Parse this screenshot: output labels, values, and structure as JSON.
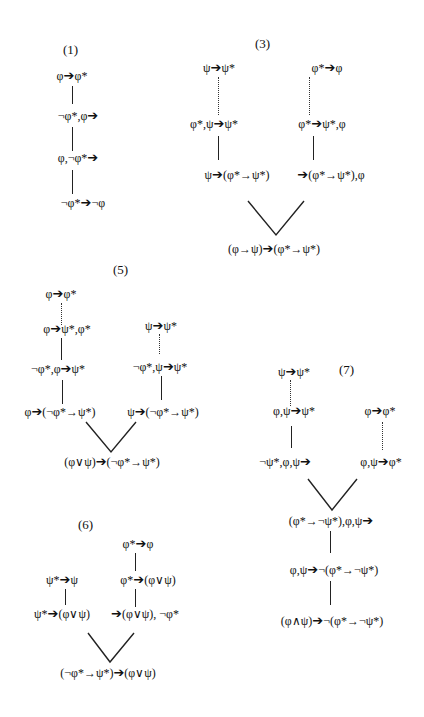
{
  "figure": {
    "proofs": [
      {
        "label": "(1)",
        "nodes": [
          "φ➔φ*",
          "¬φ*,φ➔",
          "φ,¬φ*➔",
          "¬φ*➔¬φ"
        ],
        "links": [
          "solid",
          "solid",
          "solid"
        ]
      },
      {
        "label": "(3)",
        "left_branch": [
          "ψ➔ψ*",
          "φ*,ψ➔ψ*",
          "ψ➔(φ*→ψ*)"
        ],
        "left_links": [
          "dotted",
          "solid"
        ],
        "right_branch": [
          "φ*➔φ",
          "φ*➔ψ*,φ",
          "➔(φ*→ψ*),φ"
        ],
        "right_links": [
          "dotted",
          "solid"
        ],
        "conclusion": "(φ→ψ)➔(φ*→ψ*)"
      },
      {
        "label": "(5)",
        "left_branch": [
          "φ➔φ*",
          "φ➔ψ*,φ*",
          "¬φ*,φ➔ψ*",
          "φ➔(¬φ*→ψ*)"
        ],
        "left_links": [
          "dotted",
          "solid",
          "solid"
        ],
        "right_branch": [
          "ψ➔ψ*",
          "¬φ*,ψ➔ψ*",
          "ψ➔(¬φ*→ψ*)"
        ],
        "right_links": [
          "dotted",
          "solid"
        ],
        "conclusion": "(φ∨ψ)➔(¬φ*→ψ*)"
      },
      {
        "label": "(6)",
        "left_branch": [
          "ψ*➔ψ",
          "ψ*➔(φ∨ψ)"
        ],
        "left_links": [
          "solid"
        ],
        "right_branch": [
          "φ*➔φ",
          "φ*➔(φ∨ψ)",
          "➔(φ∨ψ), ¬φ*"
        ],
        "right_links": [
          "solid",
          "solid"
        ],
        "conclusion": "(¬φ*→ψ*)➔(φ∨ψ)"
      },
      {
        "label": "(7)",
        "left_branch": [
          "ψ➔ψ*",
          "φ,ψ➔ψ*",
          "¬ψ*,φ,ψ➔"
        ],
        "left_links": [
          "dotted",
          "solid"
        ],
        "right_branch": [
          "φ➔φ*",
          "φ,ψ➔φ*"
        ],
        "right_links": [
          "dotted"
        ],
        "after_join": [
          "(φ*→¬ψ*),φ,ψ➔",
          "φ,ψ➔¬(φ*→¬ψ*)",
          "(φ∧ψ)➔¬(φ*→¬ψ*)"
        ],
        "after_join_links": [
          "solid",
          "solid"
        ]
      }
    ]
  },
  "p1": {
    "label": "(1)",
    "n0a": "φ",
    "n0b": "φ*",
    "n1a": "¬φ*,φ",
    "n1b": "",
    "n2a": "φ,¬φ*",
    "n2b": "",
    "n3a": "¬φ*",
    "n3b": "¬φ"
  },
  "p3": {
    "label": "(3)",
    "l0a": "ψ",
    "l0b": "ψ*",
    "l1a": "φ*,ψ",
    "l1b": "ψ*",
    "l2a": "ψ",
    "l2b": "(φ*→ψ*)",
    "r0a": "φ*",
    "r0b": "φ",
    "r1a": "φ*",
    "r1b": "ψ*,φ",
    "r2a": "",
    "r2b": "(φ*→ψ*),φ",
    "ca": "(φ→ψ)",
    "cb": "(φ*→ψ*)"
  },
  "p5": {
    "label": "(5)",
    "l0a": "φ",
    "l0b": "φ*",
    "l1a": "φ",
    "l1b": "ψ*,φ*",
    "l2a": "¬φ*,φ",
    "l2b": "ψ*",
    "l3a": "φ",
    "l3b": "(¬φ*→ψ*)",
    "r0a": "ψ",
    "r0b": "ψ*",
    "r1a": "¬φ*,ψ",
    "r1b": "ψ*",
    "r2a": "ψ",
    "r2b": "(¬φ*→ψ*)",
    "ca": "(φ∨ψ)",
    "cb": "(¬φ*→ψ*)"
  },
  "p6": {
    "label": "(6)",
    "l0a": "ψ*",
    "l0b": "ψ",
    "l1a": "ψ*",
    "l1b": "(φ∨ψ)",
    "r0a": "φ*",
    "r0b": "φ",
    "r1a": "φ*",
    "r1b": "(φ∨ψ)",
    "r2a": "",
    "r2b": "(φ∨ψ), ¬φ*",
    "ca": "(¬φ*→ψ*)",
    "cb": "(φ∨ψ)"
  },
  "p7": {
    "label": "(7)",
    "l0a": "ψ",
    "l0b": "ψ*",
    "l1a": "φ,ψ",
    "l1b": "ψ*",
    "l2a": "¬ψ*,φ,ψ",
    "l2b": "",
    "r0a": "φ",
    "r0b": "φ*",
    "r1a": "φ,ψ",
    "r1b": "φ*",
    "j0a": "(φ*→¬ψ*),φ,ψ",
    "j0b": "",
    "j1a": "φ,ψ",
    "j1b": "¬(φ*→¬ψ*)",
    "j2a": "(φ∧ψ)",
    "j2b": "¬(φ*→¬ψ*)"
  },
  "symbols": {
    "sequent_arrow": "➔"
  }
}
